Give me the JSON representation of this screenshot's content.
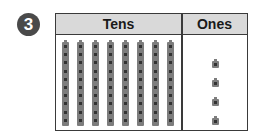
{
  "problem": {
    "number": "3"
  },
  "table": {
    "headers": {
      "tens": "Tens",
      "ones": "Ones"
    },
    "tens_rods": 8,
    "ones_cubes": 4
  },
  "colors": {
    "badge": "#4a4a4a",
    "header_fill": "#d9d9d9",
    "block": "#7d7d7d",
    "border": "#3a3a3a"
  }
}
